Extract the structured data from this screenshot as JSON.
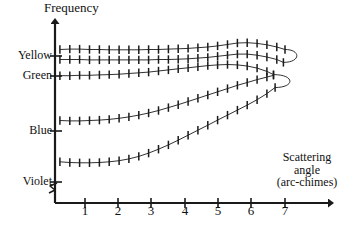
{
  "figure": {
    "title": "",
    "background": "#ffffff",
    "ink_color": "#1a1a1a"
  },
  "axes": {
    "y_axis_label": "Frequency",
    "x_axis_label_line1": "Scattering",
    "x_axis_label_line2": "angle",
    "x_axis_label_line3": "(arc-chimes)",
    "x_axis_label_full": "Scattering angle (arc-chimes)",
    "y_axis_break_symbol": "zigzag-break",
    "y_category_labels": [
      "Yellow",
      "Green",
      "Blue",
      "Violet"
    ],
    "x_tick_labels": [
      "1",
      "2",
      "3",
      "4",
      "5",
      "6",
      "7"
    ],
    "x_tick_values": [
      1,
      2,
      3,
      4,
      5,
      6,
      7
    ],
    "y_axis_arrow": true,
    "x_axis_arrow": true
  },
  "chart_data": {
    "type": "scatter",
    "title": "",
    "xlabel": "Scattering angle (arc-chimes)",
    "ylabel": "Frequency",
    "xlim": [
      0,
      7.8
    ],
    "ylim": [
      0,
      5
    ],
    "grid": false,
    "legend": "none",
    "errorbars": "vertical",
    "x_ticks": [
      1,
      2,
      3,
      4,
      5,
      6,
      7
    ],
    "y_ticks": [
      {
        "label": "Yellow",
        "value": 4.0
      },
      {
        "label": "Green",
        "value": 3.55
      },
      {
        "label": "Blue",
        "value": 2.3
      },
      {
        "label": "Violet",
        "value": 1.15
      }
    ],
    "series": [
      {
        "name": "branch-upper",
        "points": [
          [
            0.15,
            4.28
          ],
          [
            0.45,
            4.29
          ],
          [
            0.75,
            4.29
          ],
          [
            1.05,
            4.28
          ],
          [
            1.35,
            4.28
          ],
          [
            1.65,
            4.27
          ],
          [
            1.95,
            4.27
          ],
          [
            2.25,
            4.27
          ],
          [
            2.55,
            4.27
          ],
          [
            2.85,
            4.28
          ],
          [
            3.15,
            4.28
          ],
          [
            3.45,
            4.29
          ],
          [
            3.75,
            4.3
          ],
          [
            4.05,
            4.31
          ],
          [
            4.35,
            4.33
          ],
          [
            4.65,
            4.35
          ],
          [
            4.95,
            4.38
          ],
          [
            5.25,
            4.42
          ],
          [
            5.55,
            4.46
          ],
          [
            5.85,
            4.47
          ],
          [
            6.15,
            4.45
          ],
          [
            6.45,
            4.41
          ],
          [
            6.75,
            4.35
          ],
          [
            7.0,
            4.28
          ]
        ]
      },
      {
        "name": "branch-yellow",
        "points": [
          [
            0.15,
            4.0
          ],
          [
            0.45,
            4.0
          ],
          [
            0.75,
            4.0
          ],
          [
            1.05,
            3.99
          ],
          [
            1.35,
            3.99
          ],
          [
            1.65,
            3.99
          ],
          [
            1.95,
            3.99
          ],
          [
            2.25,
            3.99
          ],
          [
            2.55,
            3.99
          ],
          [
            2.85,
            3.99
          ],
          [
            3.15,
            4.0
          ],
          [
            3.45,
            4.0
          ],
          [
            3.75,
            4.01
          ],
          [
            4.05,
            4.02
          ],
          [
            4.35,
            4.04
          ],
          [
            4.65,
            4.06
          ],
          [
            4.95,
            4.09
          ],
          [
            5.25,
            4.12
          ],
          [
            5.55,
            4.15
          ],
          [
            5.85,
            4.15
          ],
          [
            6.15,
            4.12
          ],
          [
            6.45,
            4.07
          ],
          [
            6.75,
            4.0
          ],
          [
            6.95,
            3.92
          ]
        ]
      },
      {
        "name": "branch-green",
        "points": [
          [
            0.15,
            3.55
          ],
          [
            0.45,
            3.55
          ],
          [
            0.75,
            3.56
          ],
          [
            1.05,
            3.56
          ],
          [
            1.35,
            3.57
          ],
          [
            1.65,
            3.58
          ],
          [
            1.95,
            3.59
          ],
          [
            2.25,
            3.61
          ],
          [
            2.55,
            3.63
          ],
          [
            2.85,
            3.65
          ],
          [
            3.15,
            3.68
          ],
          [
            3.45,
            3.71
          ],
          [
            3.75,
            3.74
          ],
          [
            4.05,
            3.77
          ],
          [
            4.35,
            3.8
          ],
          [
            4.65,
            3.83
          ],
          [
            4.95,
            3.85
          ],
          [
            5.25,
            3.86
          ],
          [
            5.55,
            3.85
          ],
          [
            5.85,
            3.82
          ],
          [
            6.15,
            3.76
          ],
          [
            6.45,
            3.67
          ],
          [
            6.65,
            3.58
          ]
        ]
      },
      {
        "name": "branch-blue",
        "points": [
          [
            0.15,
            2.3
          ],
          [
            0.45,
            2.29
          ],
          [
            0.75,
            2.29
          ],
          [
            1.05,
            2.3
          ],
          [
            1.35,
            2.31
          ],
          [
            1.65,
            2.33
          ],
          [
            1.95,
            2.36
          ],
          [
            2.25,
            2.4
          ],
          [
            2.55,
            2.45
          ],
          [
            2.85,
            2.51
          ],
          [
            3.15,
            2.58
          ],
          [
            3.45,
            2.66
          ],
          [
            3.75,
            2.74
          ],
          [
            4.05,
            2.83
          ],
          [
            4.35,
            2.92
          ],
          [
            4.65,
            3.01
          ],
          [
            4.95,
            3.1
          ],
          [
            5.25,
            3.19
          ],
          [
            5.55,
            3.28
          ],
          [
            5.85,
            3.36
          ],
          [
            6.15,
            3.44
          ],
          [
            6.45,
            3.51
          ],
          [
            6.65,
            3.56
          ]
        ]
      },
      {
        "name": "branch-violet",
        "points": [
          [
            0.15,
            1.15
          ],
          [
            0.45,
            1.13
          ],
          [
            0.75,
            1.12
          ],
          [
            1.05,
            1.12
          ],
          [
            1.35,
            1.13
          ],
          [
            1.65,
            1.15
          ],
          [
            1.95,
            1.18
          ],
          [
            2.25,
            1.23
          ],
          [
            2.55,
            1.3
          ],
          [
            2.85,
            1.39
          ],
          [
            3.15,
            1.5
          ],
          [
            3.45,
            1.62
          ],
          [
            3.75,
            1.75
          ],
          [
            4.05,
            1.89
          ],
          [
            4.35,
            2.03
          ],
          [
            4.65,
            2.17
          ],
          [
            4.95,
            2.31
          ],
          [
            5.25,
            2.45
          ],
          [
            5.55,
            2.59
          ],
          [
            5.85,
            2.73
          ],
          [
            6.15,
            2.88
          ],
          [
            6.45,
            3.05
          ],
          [
            6.7,
            3.22
          ]
        ]
      }
    ],
    "connectors": [
      {
        "name": "fold-upper",
        "from": "branch-yellow-end",
        "to": "branch-upper-end"
      },
      {
        "name": "fold-lower",
        "from": "branch-violet-end",
        "to": "branch-green-end"
      }
    ]
  }
}
